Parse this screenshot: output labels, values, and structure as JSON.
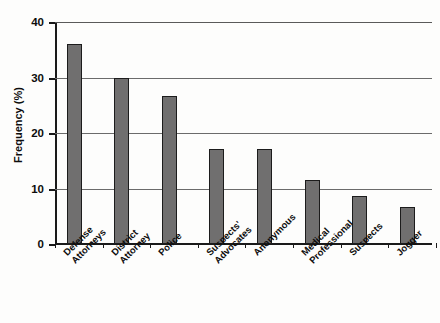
{
  "chart_data": {
    "type": "bar",
    "title": "",
    "xlabel": "",
    "ylabel": "Frequency (%)",
    "ylim": [
      0,
      40
    ],
    "yticks": [
      0,
      10,
      20,
      30,
      40
    ],
    "ytick_labels": [
      "0",
      "10",
      "20",
      "30",
      "40"
    ],
    "grid": true,
    "legend": "none",
    "bar_color": "#706f6f",
    "bar_edge_color": "#1c1c1c",
    "axis_color": "#1a1a1a",
    "gridline_color": "#6b6b6b",
    "categories": [
      "Defense Attorneys",
      "District Attorney",
      "Police",
      "Suspects' Advocates",
      "Anonymous",
      "Medical Professional",
      "Suspects",
      "Jogger"
    ],
    "category_lines": [
      [
        "Defense",
        "Attorneys"
      ],
      [
        "District",
        "Attorney"
      ],
      [
        "Police",
        ""
      ],
      [
        "Suspects'",
        "Advocates"
      ],
      [
        "Anonymous",
        ""
      ],
      [
        "Medical",
        "Professional"
      ],
      [
        "Suspects",
        ""
      ],
      [
        "Jogger",
        ""
      ]
    ],
    "values": [
      36.0,
      29.9,
      26.7,
      17.1,
      17.1,
      11.5,
      8.7,
      6.6
    ]
  }
}
